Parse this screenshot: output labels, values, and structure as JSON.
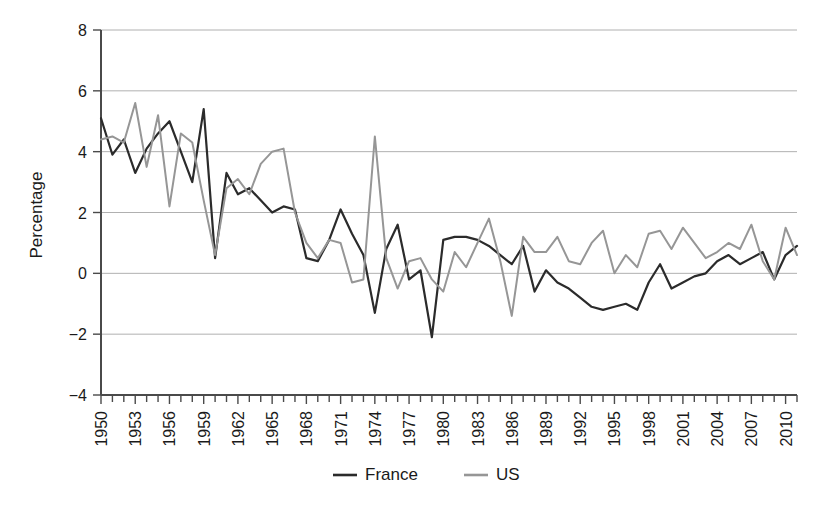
{
  "chart_data": {
    "type": "line",
    "title": "",
    "xlabel": "",
    "ylabel": "Percentage",
    "ylim": [
      -4,
      8
    ],
    "ytick_values": [
      -4,
      -2,
      0,
      2,
      4,
      6,
      8
    ],
    "ytick_labels": [
      "−4",
      "−2",
      "0",
      "2",
      "4",
      "6",
      "8"
    ],
    "grid": true,
    "grid_axis": "y",
    "legend_position": "bottom-center",
    "xlim": [
      1950,
      2011
    ],
    "xtick_labels": [
      "1950",
      "1953",
      "1956",
      "1959",
      "1962",
      "1965",
      "1968",
      "1971",
      "1974",
      "1977",
      "1980",
      "1983",
      "1986",
      "1989",
      "1992",
      "1995",
      "1998",
      "2001",
      "2004",
      "2007",
      "2010"
    ],
    "xtick_step": 3,
    "x": [
      1950,
      1951,
      1952,
      1953,
      1954,
      1955,
      1956,
      1957,
      1958,
      1959,
      1960,
      1961,
      1962,
      1963,
      1964,
      1965,
      1966,
      1967,
      1968,
      1969,
      1970,
      1971,
      1972,
      1973,
      1974,
      1975,
      1976,
      1977,
      1978,
      1979,
      1980,
      1981,
      1982,
      1983,
      1984,
      1985,
      1986,
      1987,
      1988,
      1989,
      1990,
      1991,
      1992,
      1993,
      1994,
      1995,
      1996,
      1997,
      1998,
      1999,
      2000,
      2001,
      2002,
      2003,
      2004,
      2005,
      2006,
      2007,
      2008,
      2009,
      2010,
      2011
    ],
    "series": [
      {
        "name": "France",
        "color": "#2b2b2b",
        "values": [
          5.1,
          3.9,
          4.4,
          3.3,
          4.1,
          4.6,
          5.0,
          4.0,
          3.0,
          5.4,
          0.5,
          3.3,
          2.6,
          2.8,
          2.4,
          2.0,
          2.2,
          2.1,
          0.5,
          0.4,
          1.1,
          2.1,
          1.3,
          0.6,
          -1.3,
          0.8,
          1.6,
          -0.2,
          0.1,
          -2.1,
          1.1,
          1.2,
          1.2,
          1.1,
          0.9,
          0.6,
          0.3,
          0.9,
          -0.6,
          0.1,
          -0.3,
          -0.5,
          -0.8,
          -1.1,
          -1.2,
          -1.1,
          -1.0,
          -1.2,
          -0.3,
          0.3,
          -0.5,
          -0.3,
          -0.1,
          0.0,
          0.4,
          0.6,
          0.3,
          0.5,
          0.7,
          -0.2,
          0.6,
          0.9
        ]
      },
      {
        "name": "US",
        "color": "#969696",
        "values": [
          4.4,
          4.5,
          4.3,
          5.6,
          3.5,
          5.2,
          2.2,
          4.6,
          4.3,
          2.4,
          0.6,
          2.8,
          3.1,
          2.6,
          3.6,
          4.0,
          4.1,
          2.0,
          1.0,
          0.5,
          1.1,
          1.0,
          -0.3,
          -0.2,
          4.5,
          0.5,
          -0.5,
          0.4,
          0.5,
          -0.2,
          -0.6,
          0.7,
          0.2,
          1.0,
          1.8,
          0.4,
          -1.4,
          1.2,
          0.7,
          0.7,
          1.2,
          0.4,
          0.3,
          1.0,
          1.4,
          0.0,
          0.6,
          0.2,
          1.3,
          1.4,
          0.8,
          1.5,
          1.0,
          0.5,
          0.7,
          1.0,
          0.8,
          1.6,
          0.4,
          -0.2,
          1.5,
          0.6
        ]
      }
    ],
    "legend": [
      {
        "label": "France",
        "color": "#2b2b2b"
      },
      {
        "label": "US",
        "color": "#969696"
      }
    ]
  }
}
